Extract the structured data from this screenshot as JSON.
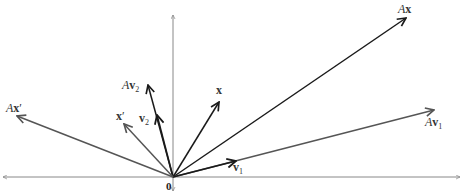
{
  "diagram": {
    "origin_label": "0",
    "origin": [
      173,
      177
    ],
    "axes": {
      "horizontal": {
        "x1": 3,
        "x2": 460,
        "y": 177
      },
      "vertical": {
        "x": 173,
        "y1": 15,
        "y2": 191
      }
    },
    "colors": {
      "dark_vector": "#1a1a1a",
      "gray_vector": "#555555",
      "axis": "#888888"
    },
    "vectors": [
      {
        "id": "Ax",
        "label_prefix": "A",
        "label_bold": "x",
        "label_suffix": "",
        "subscript": "",
        "tip": [
          406,
          18
        ],
        "label_pos": [
          398,
          13
        ],
        "color": "dark"
      },
      {
        "id": "Av1",
        "label_prefix": "A",
        "label_bold": "v",
        "label_suffix": "",
        "subscript": "1",
        "tip": [
          434,
          110
        ],
        "label_pos": [
          425,
          126
        ],
        "color": "gray"
      },
      {
        "id": "v1",
        "label_prefix": "",
        "label_bold": "v",
        "label_suffix": "",
        "subscript": "1",
        "tip": [
          236,
          161
        ],
        "label_pos": [
          233,
          171
        ],
        "color": "dark",
        "mid_arrow": true
      },
      {
        "id": "x",
        "label_prefix": "",
        "label_bold": "x",
        "label_suffix": "",
        "subscript": "",
        "tip": [
          219,
          102
        ],
        "label_pos": [
          216,
          94
        ],
        "color": "dark"
      },
      {
        "id": "v2",
        "label_prefix": "",
        "label_bold": "v",
        "label_suffix": "",
        "subscript": "2",
        "tip": [
          157,
          115
        ],
        "label_pos": [
          139,
          122
        ],
        "color": "dark",
        "mid_arrow": true
      },
      {
        "id": "Av2",
        "label_prefix": "A",
        "label_bold": "v",
        "label_suffix": "",
        "subscript": "2",
        "tip": [
          148,
          85
        ],
        "label_pos": [
          122,
          89
        ],
        "color": "dark"
      },
      {
        "id": "xprime",
        "label_prefix": "",
        "label_bold": "x",
        "label_suffix": "′",
        "subscript": "",
        "tip": [
          124,
          124
        ],
        "label_pos": [
          116,
          120
        ],
        "color": "gray"
      },
      {
        "id": "Axprime",
        "label_prefix": "A",
        "label_bold": "x",
        "label_suffix": "′",
        "subscript": "",
        "tip": [
          17,
          116
        ],
        "label_pos": [
          6,
          112
        ],
        "color": "gray"
      }
    ]
  }
}
